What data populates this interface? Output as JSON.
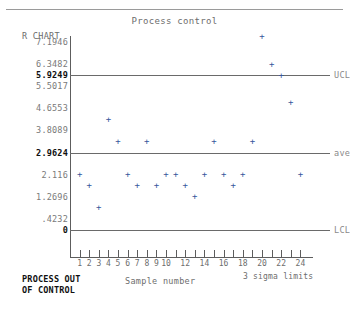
{
  "chart_data": {
    "type": "scatter",
    "title": "Process control",
    "ylabel": "R CHART",
    "xlabel": "Sample number",
    "note": "3 sigma limits",
    "status": [
      "PROCESS OUT",
      "OF CONTROL"
    ],
    "ylim": [
      0,
      7.1946
    ],
    "xlim": [
      0,
      25
    ],
    "grid": false,
    "legend": "none",
    "y_ticks": [
      {
        "value": 7.1946,
        "label": "7.1946",
        "bold": false
      },
      {
        "value": 6.3482,
        "label": "6.3482",
        "bold": false
      },
      {
        "value": 5.9249,
        "label": "5.9249",
        "bold": true
      },
      {
        "value": 5.5017,
        "label": "5.5017",
        "bold": false
      },
      {
        "value": 4.6553,
        "label": "4.6553",
        "bold": false
      },
      {
        "value": 3.8089,
        "label": "3.8089",
        "bold": false
      },
      {
        "value": 2.9624,
        "label": "2.9624",
        "bold": true
      },
      {
        "value": 2.116,
        "label": "2.116",
        "bold": false
      },
      {
        "value": 1.2696,
        "label": "1.2696",
        "bold": false
      },
      {
        "value": 0.4232,
        "label": ".4232",
        "bold": false
      },
      {
        "value": 0,
        "label": "0",
        "bold": true
      }
    ],
    "x_ticks": [
      1,
      2,
      3,
      4,
      5,
      6,
      7,
      8,
      9,
      10,
      11,
      12,
      13,
      14,
      15,
      16,
      17,
      18,
      19,
      20,
      21,
      22,
      23,
      24
    ],
    "x_tick_labels": [
      {
        "value": 1,
        "label": "1"
      },
      {
        "value": 2,
        "label": "2"
      },
      {
        "value": 3,
        "label": "3"
      },
      {
        "value": 4,
        "label": "4"
      },
      {
        "value": 5,
        "label": "5"
      },
      {
        "value": 6,
        "label": "6"
      },
      {
        "value": 7,
        "label": "7"
      },
      {
        "value": 8,
        "label": "8"
      },
      {
        "value": 9,
        "label": "9"
      },
      {
        "value": 10,
        "label": "10"
      },
      {
        "value": 12,
        "label": "12"
      },
      {
        "value": 14,
        "label": "14"
      },
      {
        "value": 16,
        "label": "16"
      },
      {
        "value": 18,
        "label": "18"
      },
      {
        "value": 20,
        "label": "20"
      },
      {
        "value": 22,
        "label": "22"
      },
      {
        "value": 24,
        "label": "24"
      }
    ],
    "control_limits": [
      {
        "name": "UCL",
        "value": 5.9249
      },
      {
        "name": "ave",
        "value": 2.9624
      },
      {
        "name": "LCL",
        "value": 0
      }
    ],
    "series": [
      {
        "name": "R",
        "marker": "+",
        "color": "#36569c",
        "x": [
          1,
          2,
          3,
          4,
          5,
          6,
          7,
          8,
          9,
          10,
          11,
          12,
          13,
          14,
          15,
          16,
          17,
          18,
          19,
          20,
          21,
          22,
          23,
          24
        ],
        "values": [
          2.12,
          1.69,
          0.85,
          4.23,
          3.39,
          2.12,
          1.69,
          3.39,
          1.69,
          2.12,
          2.12,
          1.69,
          1.27,
          2.12,
          3.39,
          2.12,
          1.69,
          2.12,
          3.39,
          7.41,
          6.35,
          5.93,
          4.87,
          2.12
        ]
      }
    ]
  }
}
